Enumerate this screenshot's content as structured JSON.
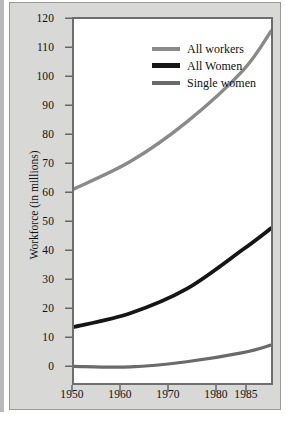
{
  "chart_data": {
    "type": "line",
    "title": "",
    "xlabel": "",
    "ylabel": "Workforce (in millions)",
    "x": [
      1950,
      1960,
      1970,
      1980,
      1985
    ],
    "xtick_labels": [
      "1950",
      "1960",
      "1970",
      "1980",
      "1985"
    ],
    "ytick_labels": [
      "0",
      "10",
      "20",
      "30",
      "40",
      "50",
      "60",
      "70",
      "80",
      "90",
      "100",
      "110",
      "120"
    ],
    "ytick_values": [
      0,
      10,
      20,
      30,
      40,
      50,
      60,
      70,
      80,
      90,
      100,
      110,
      120
    ],
    "xlim": [
      1950,
      1985
    ],
    "ylim": [
      0,
      120
    ],
    "grid": false,
    "legend_position": "upper left inside plot",
    "series": [
      {
        "name": "All workers",
        "color": "#8a8a8a",
        "values": [
          64,
          73,
          86,
          103,
          116
        ]
      },
      {
        "name": "All Women",
        "color": "#161616",
        "values": [
          18.5,
          23,
          31,
          44,
          51
        ]
      },
      {
        "name": "Single women",
        "color": "#6a6a6a",
        "values": [
          5.5,
          5.3,
          7,
          10,
          12.5
        ]
      }
    ]
  },
  "figure": {
    "background_color": "#d8d8d6",
    "plot_background_color": "#ffffff",
    "frame_color": "#6e6e6e"
  }
}
